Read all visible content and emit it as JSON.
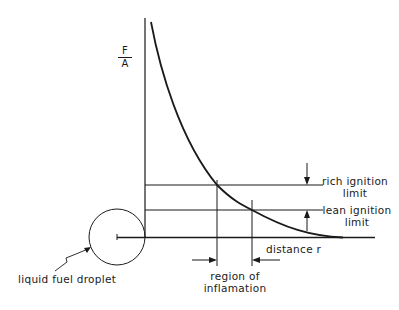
{
  "diagram": {
    "y_axis_label": {
      "numerator": "F",
      "denominator": "A"
    },
    "labels": {
      "rich_limit": [
        "rich ignition",
        "limit"
      ],
      "lean_limit": [
        "lean ignition",
        "limit"
      ],
      "distance": "distance r",
      "region": [
        "region of",
        "inflamation"
      ],
      "droplet": "liquid fuel droplet"
    },
    "colors": {
      "ink": "#1a1a1a",
      "background": "#ffffff"
    }
  }
}
